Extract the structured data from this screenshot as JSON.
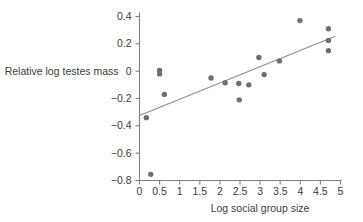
{
  "chart_data": {
    "type": "scatter",
    "title": "",
    "xlabel": "Log social group size",
    "ylabel": "Relative log testes mass",
    "xlim": [
      0,
      5
    ],
    "ylim": [
      -0.8,
      0.4
    ],
    "xticks": [
      "0",
      "0.5",
      "1",
      "1.5",
      "2",
      "2.5",
      "3",
      "3.5",
      "4",
      "4.5",
      "5"
    ],
    "xtick_values": [
      0,
      0.5,
      1,
      1.5,
      2,
      2.5,
      3,
      3.5,
      4,
      4.5,
      5
    ],
    "yticks": [
      "0.4",
      "0.2",
      "0",
      "−0.2",
      "−0.4",
      "−0.6",
      "−0.8"
    ],
    "ytick_values": [
      0.4,
      0.2,
      0,
      -0.2,
      -0.4,
      -0.6,
      -0.8
    ],
    "grid": false,
    "legend": null,
    "point_color": "#6e6e78",
    "line_color": "#8c8c8c",
    "axis_color": "#808080",
    "text_color": "#3c3c3c",
    "points": [
      {
        "x": 0.17,
        "y": -0.34
      },
      {
        "x": 0.28,
        "y": -0.755
      },
      {
        "x": 0.5,
        "y": 0.005
      },
      {
        "x": 0.5,
        "y": -0.02
      },
      {
        "x": 0.62,
        "y": -0.17
      },
      {
        "x": 1.78,
        "y": -0.05
      },
      {
        "x": 2.13,
        "y": -0.085
      },
      {
        "x": 2.47,
        "y": -0.09
      },
      {
        "x": 2.48,
        "y": -0.21
      },
      {
        "x": 2.72,
        "y": -0.1
      },
      {
        "x": 2.97,
        "y": 0.1
      },
      {
        "x": 3.1,
        "y": -0.025
      },
      {
        "x": 3.48,
        "y": 0.075
      },
      {
        "x": 3.99,
        "y": 0.37
      },
      {
        "x": 4.7,
        "y": 0.31
      },
      {
        "x": 4.7,
        "y": 0.225
      },
      {
        "x": 4.7,
        "y": 0.15
      }
    ],
    "fit_line": {
      "x0": 0.0,
      "y0": -0.325,
      "x1": 4.87,
      "y1": 0.255
    }
  }
}
